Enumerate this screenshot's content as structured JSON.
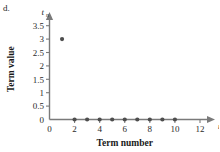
{
  "part_label": "d.",
  "chart_data": {
    "type": "scatter",
    "title": "",
    "xlabel": "Term number",
    "ylabel": "Term value",
    "x_axis_variable": "n",
    "y_axis_variable": "t",
    "y_axis_variable_subscript": "n",
    "xlim": [
      0,
      12
    ],
    "ylim": [
      0,
      3.75
    ],
    "xticks": [
      0,
      2,
      4,
      6,
      8,
      10,
      12
    ],
    "xtick_labels": [
      "0",
      "2",
      "4",
      "6",
      "8",
      "10",
      "12"
    ],
    "yticks": [
      0,
      0.5,
      1,
      1.5,
      2,
      2.5,
      3,
      3.5
    ],
    "ytick_labels": [
      "0",
      "0.5",
      "1",
      "1.5",
      "2",
      "2.5",
      "3",
      "3.5"
    ],
    "grid": false,
    "legend": false,
    "point_color": "#4d4d4d",
    "axis_color": "#7a7a7a",
    "series": [
      {
        "name": "terms",
        "x": [
          1,
          2,
          3,
          4,
          5,
          6,
          7,
          8,
          9,
          10
        ],
        "y": [
          3,
          0,
          0,
          0,
          0,
          0,
          0,
          0,
          0,
          0
        ]
      }
    ]
  }
}
